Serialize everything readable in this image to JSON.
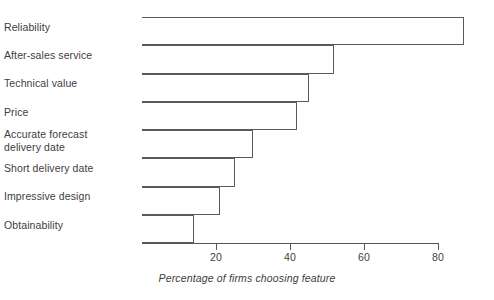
{
  "chart_data": {
    "type": "bar",
    "orientation": "horizontal",
    "title": "",
    "subtitle": "",
    "xlabel": "Percentage of firms choosing feature",
    "ylabel": "",
    "categories": [
      "Reliability",
      "After-sales service",
      "Technical value",
      "Price",
      "Accurate forecast\ndelivery date",
      "Short delivery date",
      "Impressive design",
      "Obtainability"
    ],
    "values": [
      87,
      52,
      45,
      42,
      30,
      25,
      21,
      14
    ],
    "xlim": [
      0,
      87
    ],
    "xticks": [
      20,
      40,
      60,
      80
    ],
    "xtick_labels": [
      "20",
      "40",
      "60",
      "80"
    ],
    "grid": false,
    "legend": null,
    "bar_fill": "#ffffff",
    "bar_stroke": "#5a5a5a",
    "axis_color": "#555555",
    "text_color": "#404040"
  },
  "axis": {
    "caption": "Percentage of firms choosing feature"
  }
}
